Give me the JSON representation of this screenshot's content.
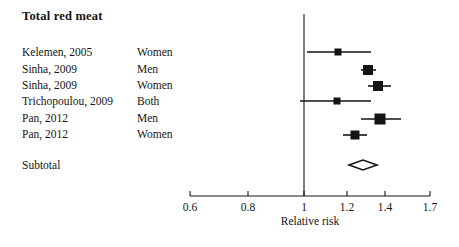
{
  "chart_data": {
    "type": "forest",
    "title": "Total red meat",
    "xlabel": "Relative risk",
    "ylabel": "",
    "grid": false,
    "legend": "none",
    "xscale": "log",
    "xlim": [
      0.6,
      1.7
    ],
    "reference_line": 1,
    "xticks": [
      {
        "value": 0.6,
        "label": "0.6",
        "x": 190
      },
      {
        "value": 0.8,
        "label": "0.8",
        "x": 248
      },
      {
        "value": 1.0,
        "label": "1",
        "x": 304
      },
      {
        "value": 1.2,
        "label": "1.2",
        "x": 347
      },
      {
        "value": 1.4,
        "label": "1.4",
        "x": 385
      },
      {
        "value": 1.7,
        "label": "1.7",
        "x": 430
      }
    ],
    "columns": [
      "Study",
      "Sex",
      "Relative risk"
    ],
    "rows": [
      {
        "study": "Kelemen, 2005",
        "sex": "Women",
        "rr": 1.16,
        "ci_low": 1.01,
        "ci_high": 1.3,
        "marker": "square",
        "weight": "small",
        "y": 52,
        "cx": 338,
        "low_x": 307,
        "high_x": 371,
        "size": 7
      },
      {
        "study": "Sinha, 2009",
        "sex": "Men",
        "rr": 1.3,
        "ci_low": 1.26,
        "ci_high": 1.35,
        "marker": "square",
        "weight": "large",
        "y": 70,
        "cx": 368,
        "low_x": 361,
        "high_x": 376,
        "size": 10
      },
      {
        "study": "Sinha, 2009",
        "sex": "Women",
        "rr": 1.32,
        "ci_low": 1.27,
        "ci_high": 1.38,
        "marker": "square",
        "weight": "large",
        "y": 86,
        "cx": 378,
        "low_x": 368,
        "high_x": 391,
        "size": 10
      },
      {
        "study": "Trichopoulou, 2009",
        "sex": "Both",
        "rr": 1.15,
        "ci_low": 0.97,
        "ci_high": 1.3,
        "marker": "square",
        "weight": "small",
        "y": 101,
        "cx": 337,
        "low_x": 300,
        "high_x": 371,
        "size": 7
      },
      {
        "study": "Pan, 2012",
        "sex": "Men",
        "rr": 1.34,
        "ci_low": 1.26,
        "ci_high": 1.44,
        "marker": "square",
        "weight": "large",
        "y": 119,
        "cx": 380,
        "low_x": 361,
        "high_x": 401,
        "size": 11
      },
      {
        "study": "Pan, 2012",
        "sex": "Women",
        "rr": 1.24,
        "ci_low": 1.18,
        "ci_high": 1.3,
        "marker": "square",
        "weight": "medium",
        "y": 135,
        "cx": 355,
        "low_x": 343,
        "high_x": 367,
        "size": 9
      }
    ],
    "summary": {
      "label": "Subtotal",
      "rr": 1.28,
      "ci_low": 1.22,
      "ci_high": 1.34,
      "marker": "diamond",
      "y": 165,
      "cx": 363,
      "low_x": 349,
      "high_x": 377,
      "half_height": 5
    },
    "axis": {
      "line_y": 196,
      "x_start": 190,
      "x_end": 430,
      "tick_len": 5,
      "tick_label_y": 202,
      "title_x": 310,
      "title_y": 216
    },
    "reference": {
      "x": 304,
      "y_top": 14,
      "y_bottom": 196
    },
    "color": "#141414"
  }
}
